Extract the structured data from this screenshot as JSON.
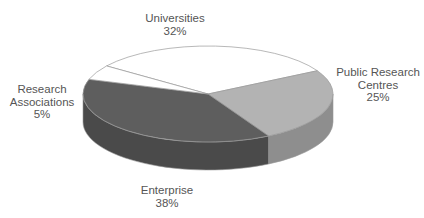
{
  "chart_data": {
    "type": "pie",
    "style": "3d",
    "title": "",
    "categories": [
      "Universities",
      "Public Research Centres",
      "Enterprise",
      "Research Associations"
    ],
    "values": [
      32,
      25,
      38,
      5
    ],
    "value_suffix": "%",
    "colors": [
      "#ffffff",
      "#b3b3b3",
      "#5e5e5e",
      "#ffffff"
    ],
    "side_colors": [
      "#e6e6e6",
      "#8e8e8e",
      "#4a4a4a",
      "#d9d9d9"
    ],
    "legend": "none",
    "labels_position": "outside"
  },
  "labels": {
    "universities": {
      "name": "Universities",
      "value": "32%"
    },
    "public_research_centres": {
      "name_line1": "Public Research",
      "name_line2": "Centres",
      "value": "25%"
    },
    "research_associations": {
      "name_line1": "Research",
      "name_line2": "Associations",
      "value": "5%"
    },
    "enterprise": {
      "name": "Enterprise",
      "value": "38%"
    }
  }
}
